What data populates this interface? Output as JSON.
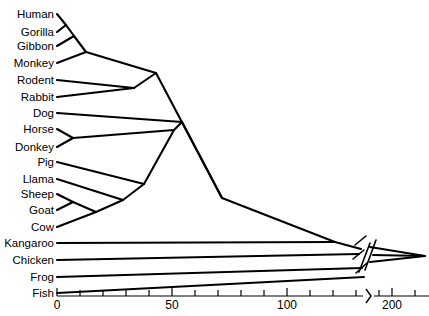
{
  "figure": {
    "type": "phylogenetic-tree",
    "orientation": "rightward-root",
    "background_color": "#ffffff",
    "line_color": "#000000"
  },
  "taxa": [
    {
      "name": "Human",
      "tip_x": 0,
      "y": 14
    },
    {
      "name": "Gorilla",
      "tip_x": 0,
      "y": 32
    },
    {
      "name": "Gibbon",
      "tip_x": 0,
      "y": 46
    },
    {
      "name": "Monkey",
      "tip_x": 0,
      "y": 63
    },
    {
      "name": "Rodent",
      "tip_x": 0,
      "y": 80
    },
    {
      "name": "Rabbit",
      "tip_x": 0,
      "y": 97
    },
    {
      "name": "Dog",
      "tip_x": 0,
      "y": 113
    },
    {
      "name": "Horse",
      "tip_x": 0,
      "y": 129
    },
    {
      "name": "Donkey",
      "tip_x": 0,
      "y": 147
    },
    {
      "name": "Pig",
      "tip_x": 0,
      "y": 162
    },
    {
      "name": "Llama",
      "tip_x": 0,
      "y": 179
    },
    {
      "name": "Sheep",
      "tip_x": 0,
      "y": 194
    },
    {
      "name": "Goat",
      "tip_x": 0,
      "y": 210
    },
    {
      "name": "Cow",
      "tip_x": 0,
      "y": 227
    },
    {
      "name": "Kangaroo",
      "tip_x": 0,
      "y": 243
    },
    {
      "name": "Chicken",
      "tip_x": 0,
      "y": 260
    },
    {
      "name": "Frog",
      "tip_x": 0,
      "y": 277
    },
    {
      "name": "Fish",
      "tip_x": 0,
      "y": 293
    }
  ],
  "axis": {
    "label_values": [
      "0",
      "50",
      "100",
      "200"
    ],
    "label_x_px": [
      57,
      172,
      287,
      392
    ],
    "tick_values": [
      0,
      10,
      20,
      30,
      40,
      50,
      60,
      70,
      80,
      90,
      100,
      110,
      120,
      130,
      140,
      150,
      160,
      170,
      180,
      190,
      200,
      210
    ],
    "minor_tick_x_px": [
      57,
      80,
      103,
      126,
      149,
      172,
      195,
      218,
      241,
      264,
      287,
      310,
      333,
      356,
      379,
      392,
      415
    ],
    "axis_break_x_px": 368,
    "axis_y_px": 296,
    "units_per_pixel": 0.4348
  },
  "chart_data": {
    "type": "tree",
    "title": "",
    "xlabel": "",
    "ylabel": "",
    "xlim": [
      0,
      215
    ],
    "grid": false,
    "legend": "none",
    "note": "Unrooted-style cladogram with broken x-axis between 150 and 190 units; branch lengths drawn as slanted (triangular) cladogram edges.",
    "tips": [
      "Human",
      "Gorilla",
      "Gibbon",
      "Monkey",
      "Rodent",
      "Rabbit",
      "Dog",
      "Horse",
      "Donkey",
      "Pig",
      "Llama",
      "Sheep",
      "Goat",
      "Cow",
      "Kangaroo",
      "Chicken",
      "Frog",
      "Fish"
    ],
    "internal_nodes": [
      {
        "id": "n_hom",
        "label": "Human+Gorilla",
        "x_px": 66,
        "y_px": 25,
        "value": 4
      },
      {
        "id": "n_hominoid",
        "label": "+Gibbon",
        "x_px": 74,
        "y_px": 36,
        "value": 7
      },
      {
        "id": "n_primate",
        "label": "+Monkey",
        "x_px": 86,
        "y_px": 52,
        "value": 13
      },
      {
        "id": "n_glires",
        "label": "Rodent+Rabbit",
        "x_px": 134,
        "y_px": 88,
        "value": 33
      },
      {
        "id": "n_euarch",
        "label": "Primates+Glires",
        "x_px": 156,
        "y_px": 73,
        "value": 43
      },
      {
        "id": "n_perisso",
        "label": "Horse+Donkey",
        "x_px": 73,
        "y_px": 138,
        "value": 7
      },
      {
        "id": "n_caprine",
        "label": "Sheep+Goat",
        "x_px": 73,
        "y_px": 202,
        "value": 7
      },
      {
        "id": "n_bovid",
        "label": "Caprine+Cow",
        "x_px": 96,
        "y_px": 212,
        "value": 17
      },
      {
        "id": "n_rumin",
        "label": "Bovid+Llama",
        "x_px": 123,
        "y_px": 200,
        "value": 29
      },
      {
        "id": "n_artio",
        "label": "+Pig",
        "x_px": 144,
        "y_px": 184,
        "value": 38
      },
      {
        "id": "n_ungul",
        "label": "Artio+Perisso",
        "x_px": 174,
        "y_px": 130,
        "value": 51
      },
      {
        "id": "n_laura",
        "label": "Ungulates+Dog",
        "x_px": 182,
        "y_px": 122,
        "value": 54
      },
      {
        "id": "n_euther",
        "label": "Placental root",
        "x_px": 222,
        "y_px": 198,
        "value": 72
      },
      {
        "id": "n_theria",
        "label": "+Kangaroo",
        "x_px": 335,
        "y_px": 242,
        "value": 121
      },
      {
        "id": "n_amniote",
        "label": "+Chicken (pre-break)",
        "x_px": 358,
        "y_px": 252,
        "value": 131
      },
      {
        "id": "n_tetra",
        "label": "+Frog (post-break)",
        "x_px": 400,
        "y_px": 256,
        "value": 196
      },
      {
        "id": "n_root",
        "label": "+Fish root",
        "x_px": 425,
        "y_px": 256,
        "value": 206
      }
    ],
    "edges": [
      [
        "n_hom",
        "Human"
      ],
      [
        "n_hom",
        "Gorilla"
      ],
      [
        "n_hominoid",
        "n_hom"
      ],
      [
        "n_hominoid",
        "Gibbon"
      ],
      [
        "n_primate",
        "n_hominoid"
      ],
      [
        "n_primate",
        "Monkey"
      ],
      [
        "n_glires",
        "Rodent"
      ],
      [
        "n_glires",
        "Rabbit"
      ],
      [
        "n_euarch",
        "n_primate"
      ],
      [
        "n_euarch",
        "n_glires"
      ],
      [
        "n_perisso",
        "Horse"
      ],
      [
        "n_perisso",
        "Donkey"
      ],
      [
        "n_caprine",
        "Sheep"
      ],
      [
        "n_caprine",
        "Goat"
      ],
      [
        "n_bovid",
        "n_caprine"
      ],
      [
        "n_bovid",
        "Cow"
      ],
      [
        "n_rumin",
        "n_bovid"
      ],
      [
        "n_rumin",
        "Llama"
      ],
      [
        "n_artio",
        "n_rumin"
      ],
      [
        "n_artio",
        "Pig"
      ],
      [
        "n_ungul",
        "n_artio"
      ],
      [
        "n_ungul",
        "n_perisso"
      ],
      [
        "n_laura",
        "n_ungul"
      ],
      [
        "n_laura",
        "Dog"
      ],
      [
        "n_euther",
        "n_euarch"
      ],
      [
        "n_euther",
        "n_laura"
      ],
      [
        "n_theria",
        "n_euther"
      ],
      [
        "n_theria",
        "Kangaroo"
      ],
      [
        "n_amniote",
        "n_theria"
      ],
      [
        "n_amniote",
        "Chicken"
      ],
      [
        "n_tetra",
        "n_amniote"
      ],
      [
        "n_tetra",
        "Frog"
      ],
      [
        "n_root",
        "n_tetra"
      ],
      [
        "n_root",
        "Fish"
      ]
    ]
  }
}
